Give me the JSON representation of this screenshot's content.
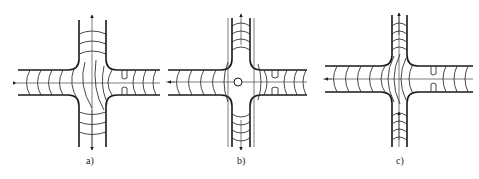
{
  "figure": {
    "panels": [
      {
        "id": "a",
        "label": "a)",
        "description": "cross junction, asymmetric flow field, inflow from right, outflow left/up/down"
      },
      {
        "id": "b",
        "label": "b)",
        "description": "cross junction with central stagnation point (circle), symmetric flow field"
      },
      {
        "id": "c",
        "label": "c)",
        "description": "cross junction, concentric arc flow lines, inflow from right and bottom, outflow left and top"
      }
    ],
    "colors": {
      "line": "#1a1a1a",
      "background": "#ffffff"
    }
  }
}
